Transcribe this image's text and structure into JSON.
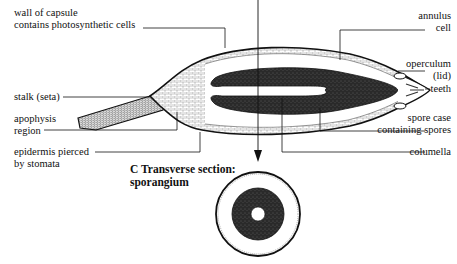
{
  "diagram": {
    "labels_left": {
      "wall_line1": "wall of capsule",
      "wall_line2": "contains photosynthetic cells",
      "stalk": "stalk (seta)",
      "apophysis_line1": "apophysis",
      "apophysis_line2": "region",
      "epidermis_line1": "epidermis pierced",
      "epidermis_line2": "by stomata"
    },
    "labels_right": {
      "annulus_line1": "annulus",
      "annulus_line2": "cell",
      "operculum_line1": "operculum",
      "operculum_line2": "(lid)",
      "teeth": "teeth",
      "spore_line1": "spore case",
      "spore_line2": "containing spores",
      "columella": "columella"
    },
    "section_title": {
      "line1": "C  Transverse section:",
      "line2": "sporangium"
    },
    "colors": {
      "ink": "#111111",
      "spore_fill": "#2a2a2a",
      "background": "#ffffff"
    }
  }
}
